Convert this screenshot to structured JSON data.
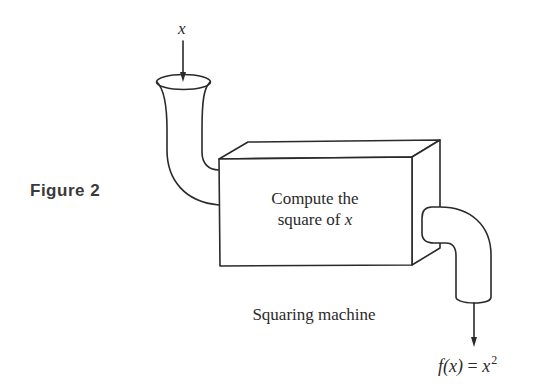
{
  "figure": {
    "label": "Figure 2",
    "input_label": "x",
    "box_text_line1": "Compute the",
    "box_text_line2_prefix": "square of ",
    "box_text_line2_var": "x",
    "caption": "Squaring machine",
    "output_label_fx": "f(x)",
    "output_label_eq": " = ",
    "output_label_x": "x",
    "output_label_exp": "2"
  },
  "colors": {
    "ink": "#2a2a2a",
    "background": "#ffffff"
  }
}
